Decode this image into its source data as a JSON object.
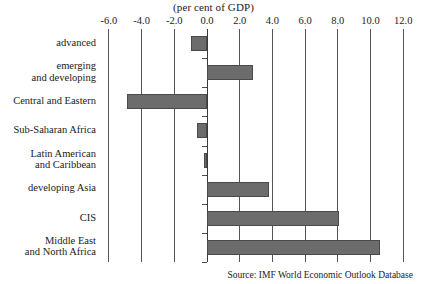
{
  "chart_data": {
    "type": "bar",
    "orientation": "horizontal",
    "title": "(per cent of GDP)",
    "xlabel": "",
    "ylabel": "",
    "xlim": [
      -7.0,
      13.0
    ],
    "xticks": [
      -6.0,
      -4.0,
      -2.0,
      0.0,
      2.0,
      4.0,
      6.0,
      8.0,
      10.0,
      12.0
    ],
    "xticklabels": [
      "-6.0",
      "-4.0",
      "-2.0",
      "0.0",
      "2.0",
      "4.0",
      "6.0",
      "8.0",
      "10.0",
      "12.0"
    ],
    "grid": true,
    "grid_axis": "x",
    "legend": false,
    "bar_color": "#6c6c6c",
    "bar_edge_color": "#4a4a4a",
    "categories": [
      "advanced",
      "emerging and developing",
      "Central and Eastern",
      "Sub-Saharan Africa",
      "Latin American and Caribbean",
      "developing Asia",
      "CIS",
      "Middle East and North Africa"
    ],
    "category_lines": [
      [
        "advanced"
      ],
      [
        "emerging",
        "and developing"
      ],
      [
        "Central and Eastern"
      ],
      [
        "Sub-Saharan Africa"
      ],
      [
        "Latin American",
        "and Caribbean"
      ],
      [
        "developing Asia"
      ],
      [
        "CIS"
      ],
      [
        "Middle East",
        "and North Africa"
      ]
    ],
    "values": [
      -1.0,
      2.8,
      -4.9,
      -0.6,
      -0.2,
      3.8,
      8.1,
      10.6
    ],
    "annotations": []
  },
  "footer": {
    "source": "Source: IMF World Economic Outlook Database"
  }
}
